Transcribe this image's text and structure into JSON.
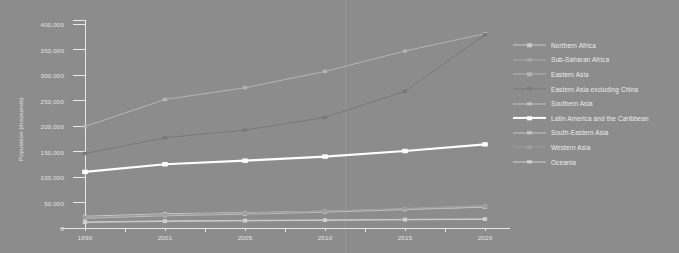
{
  "chart_data": {
    "type": "line",
    "title": "",
    "xlabel": "",
    "ylabel": "Population (thousands)",
    "categories": [
      "1990",
      "2001",
      "2005",
      "2010",
      "2015",
      "2020"
    ],
    "ylim": [
      0,
      400000
    ],
    "yticks": [
      0,
      50000,
      100000,
      150000,
      200000,
      250000,
      300000,
      350000,
      400000
    ],
    "ytick_labels": [
      "0",
      "50,000",
      "100,000",
      "150,000",
      "200,000",
      "250,000",
      "300,000",
      "350,000",
      "400,000"
    ],
    "grid": false,
    "legend_position": "right",
    "series": [
      {
        "name": "Northern Africa",
        "color": "#c9c9c9",
        "values": [
          23000,
          28000,
          30000,
          33000,
          37000,
          41000
        ]
      },
      {
        "name": "Sub-Saharan Africa",
        "color": "#a9a9a9",
        "values": [
          20000,
          26000,
          29000,
          33000,
          38000,
          44000
        ]
      },
      {
        "name": "Eastern Asia",
        "color": "#b4b4b4",
        "values": [
          199000,
          252000,
          275000,
          307000,
          347000,
          381000
        ]
      },
      {
        "name": "Eastern Asia excluding China",
        "color": "#787878",
        "values": [
          146000,
          177000,
          192000,
          217000,
          268000,
          379000
        ]
      },
      {
        "name": "Southern Asia",
        "color": "#bdbdbd",
        "values": [
          19000,
          24000,
          27000,
          31000,
          36000,
          41000
        ]
      },
      {
        "name": "Latin America and the Caribbean",
        "color": "#ffffff",
        "values": [
          110000,
          125000,
          132000,
          140000,
          151000,
          164000
        ]
      },
      {
        "name": "South-Eastern Asia",
        "color": "#c4c4c4",
        "values": [
          12000,
          14000,
          15000,
          16000,
          17000,
          18000
        ]
      },
      {
        "name": "Western Asia",
        "color": "#9e9e9e",
        "values": [
          21000,
          26000,
          29000,
          33000,
          38000,
          43000
        ]
      },
      {
        "name": "Oceania",
        "color": "#cfcfcf",
        "values": [
          11000,
          13000,
          14000,
          15000,
          16000,
          17000
        ]
      }
    ]
  },
  "colors": {
    "background": "#8c8c8c",
    "axis": "#e8e8e8",
    "text": "#ececec",
    "highlight": "#ffffff"
  }
}
